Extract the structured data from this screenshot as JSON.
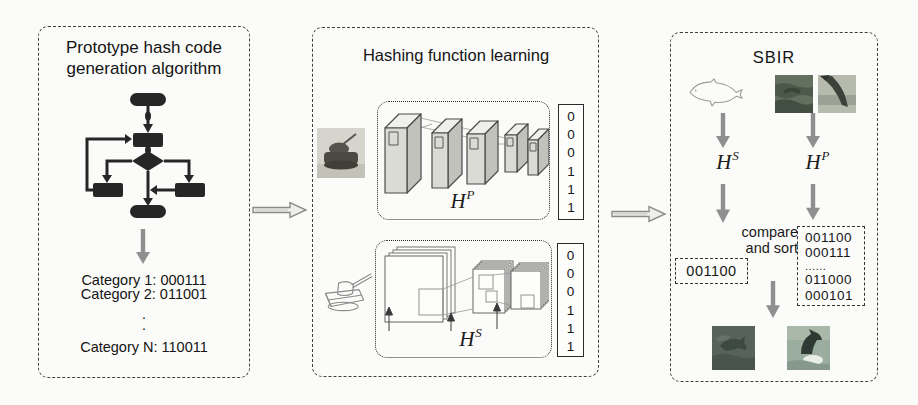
{
  "colors": {
    "panel_border": "#3f3f3f",
    "arrow_gray": "#8f8f8f",
    "flowchart_ink": "#262626",
    "text_ink": "#171717"
  },
  "left_panel": {
    "title_line1": "Prototype hash code",
    "title_line2": "generation algorithm",
    "icons": [
      "flowchart-icon",
      "down-arrow-icon"
    ],
    "categories": [
      "Category 1: 000111",
      "Category 2: 011001"
    ],
    "ellipsis_dots": [
      ".",
      "."
    ],
    "category_n": "Category N: 110011"
  },
  "middle_panel": {
    "title": "Hashing function learning",
    "photo_branch": {
      "input_icon": "tank-photo",
      "hash_base": "H",
      "hash_sup": "P",
      "bits": [
        "0",
        "0",
        "0",
        "1",
        "1",
        "1"
      ]
    },
    "sketch_branch": {
      "input_icon": "tank-sketch-icon",
      "hash_base": "H",
      "hash_sup": "S",
      "bits": [
        "0",
        "0",
        "0",
        "1",
        "1",
        "1"
      ]
    }
  },
  "right_panel": {
    "title": "SBIR",
    "sketch_query": {
      "icon": "dolphin-sketch-icon",
      "hash_base": "H",
      "hash_sup": "S",
      "code": "001100"
    },
    "photo_gallery": {
      "icons": [
        "dolphin-photo-1",
        "dolphin-photo-2"
      ],
      "hash_base": "H",
      "hash_sup": "P",
      "codes": [
        "001100",
        "000111",
        "......",
        "011000",
        "000101"
      ]
    },
    "compare_line1": "compare",
    "compare_line2": "and sort",
    "result_icons": [
      "result-photo-1",
      "result-photo-2"
    ]
  }
}
